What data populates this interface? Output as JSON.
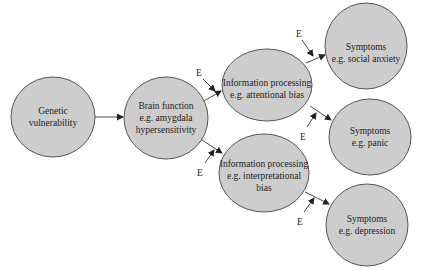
{
  "diagram": {
    "nodes": [
      {
        "id": "genetic",
        "lines": [
          "Genetic",
          "vulnerability"
        ]
      },
      {
        "id": "brain",
        "lines": [
          "Brain function",
          "e.g. amygdala",
          "hypersensitivity"
        ]
      },
      {
        "id": "info_attentional",
        "lines": [
          "Information processing",
          "e.g. attentional bias"
        ]
      },
      {
        "id": "info_interpretational",
        "lines": [
          "Information processing",
          "e.g. interpretational",
          "bias"
        ]
      },
      {
        "id": "symptoms_social",
        "lines": [
          "Symptoms",
          "e.g. social anxiety"
        ]
      },
      {
        "id": "symptoms_panic",
        "lines": [
          "Symptoms",
          "e.g. panic"
        ]
      },
      {
        "id": "symptoms_depression",
        "lines": [
          "Symptoms",
          "e.g. depression"
        ]
      }
    ],
    "edges": [
      {
        "from": "genetic",
        "to": "brain"
      },
      {
        "from": "brain",
        "to": "info_attentional"
      },
      {
        "from": "brain",
        "to": "info_interpretational"
      },
      {
        "from": "info_attentional",
        "to": "symptoms_social"
      },
      {
        "from": "info_attentional",
        "to": "symptoms_panic"
      },
      {
        "from": "info_interpretational",
        "to": "symptoms_depression"
      }
    ],
    "environment_label": "E",
    "environment_inputs": [
      {
        "label": "E",
        "target_edge": "brain->info_attentional"
      },
      {
        "label": "E",
        "target_edge": "brain->info_interpretational"
      },
      {
        "label": "E",
        "target_edge": "info_attentional->symptoms_social"
      },
      {
        "label": "E",
        "target_edge": "info_attentional->symptoms_panic"
      },
      {
        "label": "E",
        "target_edge": "info_interpretational->symptoms_depression"
      }
    ]
  }
}
